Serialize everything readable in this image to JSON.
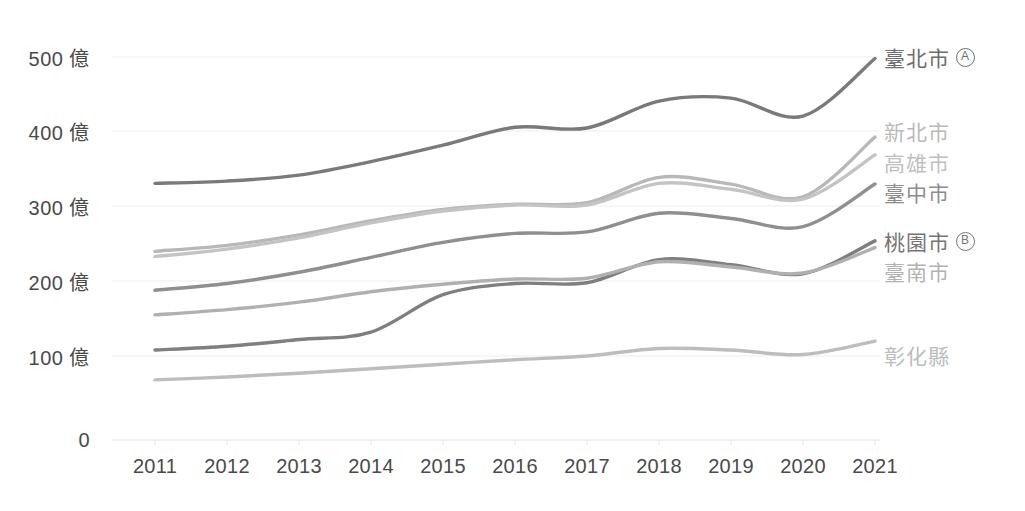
{
  "chart_data": {
    "type": "line",
    "title": "",
    "xlabel": "",
    "ylabel": "",
    "unit": "億",
    "x": [
      2011,
      2012,
      2013,
      2014,
      2015,
      2016,
      2017,
      2018,
      2019,
      2020,
      2021
    ],
    "tick_labels_x": [
      "2011",
      "2012",
      "2013",
      "2014",
      "2015",
      "2016",
      "2017",
      "2018",
      "2019",
      "2020",
      "2021"
    ],
    "tick_labels_y": [
      "0",
      "100 億",
      "200 億",
      "300 億",
      "400 億",
      "500 億"
    ],
    "ticks_y": [
      0,
      100,
      200,
      300,
      400,
      500
    ],
    "ylim": [
      0,
      520
    ],
    "grid": true,
    "grid_axis": "y",
    "legend_position": "right-inline",
    "smoothing": "spline",
    "series": [
      {
        "name": "臺北市",
        "badge": "A",
        "color": "#7a7a7a",
        "values": [
          331,
          334,
          342,
          360,
          382,
          406,
          405,
          441,
          445,
          421,
          498
        ]
      },
      {
        "name": "新北市",
        "badge": "",
        "color": "#b8b8b8",
        "values": [
          240,
          248,
          262,
          281,
          296,
          303,
          305,
          339,
          330,
          313,
          393
        ]
      },
      {
        "name": "高雄市",
        "badge": "",
        "color": "#c4c4c4",
        "values": [
          233,
          243,
          258,
          278,
          294,
          302,
          302,
          331,
          323,
          310,
          369
        ]
      },
      {
        "name": "臺中市",
        "badge": "",
        "color": "#8f8f8f",
        "values": [
          188,
          197,
          212,
          232,
          252,
          264,
          266,
          291,
          284,
          273,
          330
        ]
      },
      {
        "name": "桃園市",
        "badge": "B",
        "color": "#7f7f7f",
        "values": [
          108,
          113,
          122,
          132,
          182,
          197,
          198,
          229,
          222,
          210,
          254
        ]
      },
      {
        "name": "臺南市",
        "badge": "",
        "color": "#b0b0b0",
        "values": [
          155,
          162,
          172,
          186,
          196,
          203,
          204,
          226,
          219,
          211,
          245
        ]
      },
      {
        "name": "彰化縣",
        "badge": "",
        "color": "#bdbdbd",
        "values": [
          68,
          72,
          77,
          83,
          89,
          95,
          100,
          110,
          108,
          102,
          120
        ]
      }
    ]
  },
  "legend": [
    {
      "label": "臺北市",
      "badge": "A",
      "color": "#6e6e6e",
      "y": 57
    },
    {
      "label": "新北市",
      "badge": "",
      "color": "#b9b9b9",
      "y": 131
    },
    {
      "label": "高雄市",
      "badge": "",
      "color": "#bfbfbf",
      "y": 162
    },
    {
      "label": "臺中市",
      "badge": "",
      "color": "#8d8d8d",
      "y": 192
    },
    {
      "label": "桃園市",
      "badge": "B",
      "color": "#757575",
      "y": 241
    },
    {
      "label": "臺南市",
      "badge": "",
      "color": "#b3b3b3",
      "y": 271
    },
    {
      "label": "彰化縣",
      "badge": "",
      "color": "#bcbcbc",
      "y": 355
    }
  ],
  "axis": {
    "y_ticks": [
      {
        "label": "500 億",
        "y": 57
      },
      {
        "label": "400 億",
        "y": 131
      },
      {
        "label": "300 億",
        "y": 206
      },
      {
        "label": "200 億",
        "y": 281
      },
      {
        "label": "100 億",
        "y": 356
      },
      {
        "label": "0",
        "y": 440
      }
    ],
    "x_ticks": [
      {
        "label": "2011",
        "x": 155
      },
      {
        "label": "2012",
        "x": 227
      },
      {
        "label": "2013",
        "x": 299
      },
      {
        "label": "2014",
        "x": 371
      },
      {
        "label": "2015",
        "x": 443
      },
      {
        "label": "2016",
        "x": 515
      },
      {
        "label": "2017",
        "x": 587
      },
      {
        "label": "2018",
        "x": 659
      },
      {
        "label": "2019",
        "x": 731
      },
      {
        "label": "2020",
        "x": 803
      },
      {
        "label": "2021",
        "x": 875
      }
    ]
  },
  "colors": {
    "background": "#ffffff",
    "grid": "#ededed",
    "axis": "#e4e4e4",
    "tick_text": "#4a4a4a"
  }
}
